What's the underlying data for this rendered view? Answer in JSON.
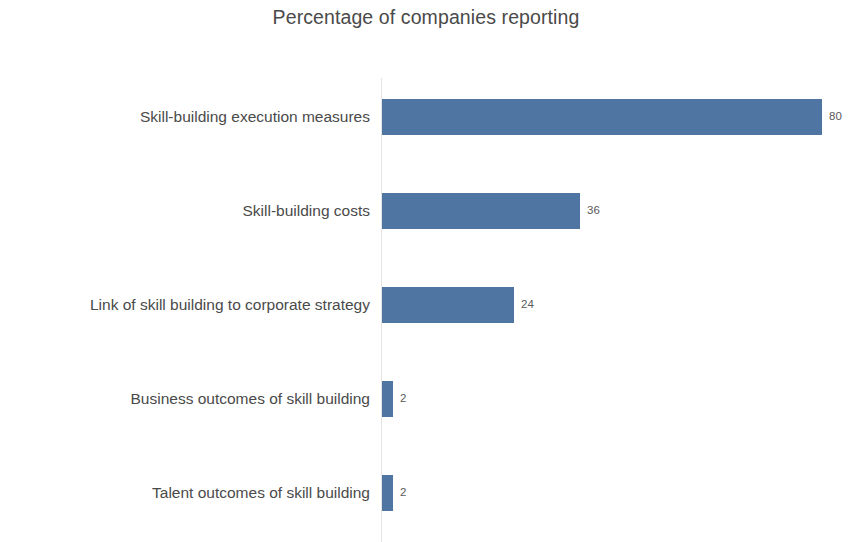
{
  "chart_data": {
    "type": "bar",
    "orientation": "horizontal",
    "title": "Percentage of companies reporting",
    "xlabel": "",
    "ylabel": "",
    "xlim": [
      0,
      80
    ],
    "grid": false,
    "legend": null,
    "bar_color": "#4f76a3",
    "text_color": "#4a4a4a",
    "axis_color": "#e4e4e4",
    "categories": [
      "Skill-building execution measures",
      "Skill-building costs",
      "Link of skill building to corporate strategy",
      "Business outcomes of skill building",
      "Talent outcomes of skill building"
    ],
    "values": [
      80,
      36,
      24,
      2,
      2
    ],
    "value_labels": [
      "80",
      "36",
      "24",
      "2",
      "2"
    ]
  }
}
